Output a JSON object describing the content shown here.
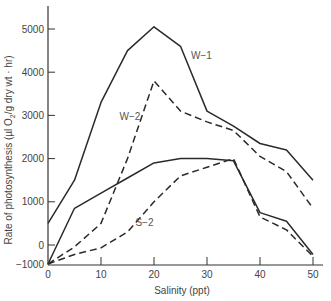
{
  "chart_data": {
    "type": "line",
    "title": "",
    "xlabel": "Salinity (ppt)",
    "ylabel": "Rate of photosynthesis (µl O₂/g dry wt · hr)",
    "ylabel_parts": {
      "prefix": "Rate of photosynthesis  (µl O",
      "sub": "2",
      "suffix": "/g dry wt · hr)"
    },
    "x": [
      0,
      5,
      10,
      15,
      20,
      25,
      30,
      35,
      40,
      45,
      50
    ],
    "xlim": [
      0,
      50
    ],
    "ylim": [
      -1000,
      5500
    ],
    "x_ticks": [
      0,
      10,
      20,
      30,
      40,
      50
    ],
    "y_ticks": [
      -1000,
      0,
      1000,
      2000,
      3000,
      4000,
      5000
    ],
    "axis_note": "Broken y-axis: the interval from -1000 to 0 is compressed",
    "grid": false,
    "legend": "inline labels",
    "series": [
      {
        "name": "W-1",
        "style": "solid",
        "label_pos": [
          27,
          4300
        ],
        "values": [
          500,
          1500,
          3300,
          4500,
          5050,
          4600,
          3100,
          2750,
          2350,
          2200,
          1500
        ]
      },
      {
        "name": "W-2",
        "style": "dashed",
        "label_pos": [
          13.5,
          2900
        ],
        "values": [
          -1000,
          -100,
          500,
          2000,
          3800,
          3100,
          2850,
          2650,
          2050,
          1700,
          850
        ]
      },
      {
        "name": "",
        "style": "solid",
        "label_pos": null,
        "values": [
          -1000,
          850,
          1200,
          1550,
          1900,
          2000,
          2000,
          1950,
          750,
          550,
          -500
        ]
      },
      {
        "name": "S-2",
        "style": "dashed",
        "label_pos": [
          16.5,
          450
        ],
        "values": [
          -1000,
          -500,
          -150,
          300,
          1000,
          1600,
          1800,
          2000,
          650,
          350,
          -600
        ]
      }
    ]
  },
  "colors": {
    "line": "#2a2a2a",
    "axis": "#333333",
    "text": "#444444"
  }
}
